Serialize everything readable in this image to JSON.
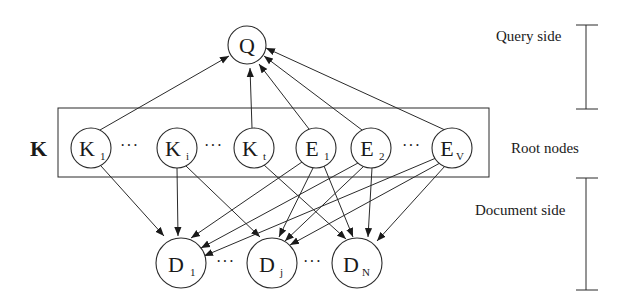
{
  "diagram": {
    "set_label": "K",
    "nodes": {
      "Q": {
        "main": "Q",
        "sub": ""
      },
      "K1": {
        "main": "K",
        "sub": "1"
      },
      "Ki": {
        "main": "K",
        "sub": "i"
      },
      "Kt": {
        "main": "K",
        "sub": "t"
      },
      "E1": {
        "main": "E",
        "sub": "1"
      },
      "E2": {
        "main": "E",
        "sub": "2"
      },
      "Ev": {
        "main": "E",
        "sub": "V"
      },
      "D1": {
        "main": "D",
        "sub": "1"
      },
      "Dj": {
        "main": "D",
        "sub": "j"
      },
      "DN": {
        "main": "D",
        "sub": "N"
      }
    },
    "ellipsis": "···",
    "edges_to_query": [
      "K1",
      "Kt",
      "E1",
      "E2",
      "Ev"
    ],
    "edges_to_documents": [
      [
        "K1",
        "D1"
      ],
      [
        "Ki",
        "D1"
      ],
      [
        "Ki",
        "Dj"
      ],
      [
        "Kt",
        "DN"
      ],
      [
        "E1",
        "D1"
      ],
      [
        "E1",
        "Dj"
      ],
      [
        "E1",
        "DN"
      ],
      [
        "E2",
        "D1"
      ],
      [
        "E2",
        "Dj"
      ],
      [
        "E2",
        "DN"
      ],
      [
        "Ev",
        "D1"
      ],
      [
        "Ev",
        "Dj"
      ],
      [
        "Ev",
        "DN"
      ]
    ],
    "side_labels": {
      "query": "Query side",
      "root": "Root nodes",
      "document": "Document side"
    }
  }
}
